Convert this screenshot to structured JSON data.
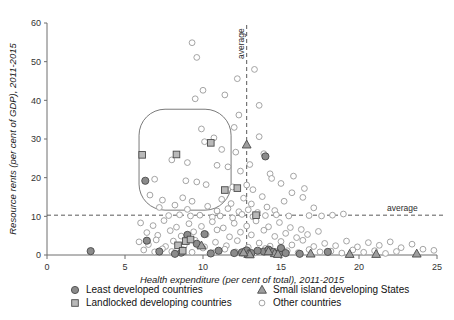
{
  "chart_data": {
    "type": "scatter",
    "title": "",
    "xlabel": "Health expenditure (per cent of total), 2011-2015",
    "ylabel": "Resource rents (per cent of GDP), 2011-2015",
    "xlim": [
      0,
      25
    ],
    "ylim": [
      0,
      60
    ],
    "xticks": [
      0,
      5,
      10,
      15,
      20,
      25
    ],
    "yticks": [
      0,
      10,
      20,
      30,
      40,
      50,
      60
    ],
    "grid": false,
    "legend_position": "below-axis",
    "annotations": [
      {
        "label": "average",
        "type": "vertical-line",
        "value": 12.8,
        "orientation": "vertical"
      },
      {
        "label": "average",
        "type": "horizontal-line",
        "value": 10.3,
        "orientation": "horizontal"
      },
      {
        "label": "",
        "type": "rounded-rect-highlight",
        "x_range": [
          5.9,
          11.8
        ],
        "y_range": [
          11.6,
          37.7
        ]
      }
    ],
    "series": [
      {
        "name": "Least developed countries",
        "marker": "filled-circle",
        "color": "#8b8b8b",
        "points": [
          [
            6.3,
            19.2
          ],
          [
            2.8,
            1.0
          ],
          [
            6.4,
            3.7
          ],
          [
            7.2,
            0.9
          ],
          [
            8.6,
            0.6
          ],
          [
            9.6,
            2.9
          ],
          [
            10.1,
            5.4
          ],
          [
            11.0,
            1.1
          ],
          [
            12.5,
            0.7
          ],
          [
            12.8,
            1.2
          ],
          [
            13.1,
            0.5
          ],
          [
            13.9,
            0.9
          ],
          [
            14.2,
            1.4
          ],
          [
            14.5,
            0.8
          ],
          [
            14.9,
            0.6
          ],
          [
            15.0,
            1.8
          ],
          [
            14.0,
            25.5
          ],
          [
            18.0,
            0.8
          ],
          [
            9.0,
            5.2
          ],
          [
            10.5,
            0.4
          ],
          [
            12.0,
            0.5
          ],
          [
            13.5,
            1.1
          ],
          [
            15.3,
            0.5
          ],
          [
            16.2,
            0.3
          ],
          [
            8.2,
            0.3
          ]
        ]
      },
      {
        "name": "Landlocked developing countries",
        "marker": "filled-square",
        "color": "#b9b9b9",
        "points": [
          [
            6.1,
            25.9
          ],
          [
            8.3,
            26.0
          ],
          [
            10.5,
            29.0
          ],
          [
            11.4,
            16.8
          ],
          [
            12.2,
            17.3
          ],
          [
            13.4,
            10.3
          ],
          [
            8.9,
            3.6
          ],
          [
            8.4,
            2.5
          ],
          [
            9.2,
            4.0
          ],
          [
            8.7,
            1.1
          ]
        ]
      },
      {
        "name": "Small island developing States",
        "marker": "filled-triangle",
        "color": "#9e9e9e",
        "points": [
          [
            12.8,
            28.5
          ],
          [
            9.9,
            2.4
          ],
          [
            12.9,
            0.2
          ],
          [
            13.0,
            0.1
          ],
          [
            14.6,
            0.4
          ],
          [
            14.8,
            0.2
          ],
          [
            16.9,
            0.3
          ],
          [
            19.4,
            0.2
          ],
          [
            21.1,
            0.2
          ],
          [
            23.7,
            0.3
          ],
          [
            14.2,
            0.9
          ],
          [
            12.6,
            0.6
          ]
        ]
      },
      {
        "name": "Other countries",
        "marker": "open-circle",
        "color": "#ffffff",
        "points": [
          [
            9.3,
            54.9
          ],
          [
            9.6,
            51.1
          ],
          [
            12.2,
            45.6
          ],
          [
            10.0,
            42.6
          ],
          [
            11.4,
            41.4
          ],
          [
            9.5,
            40.4
          ],
          [
            13.6,
            38.7
          ],
          [
            13.6,
            30.6
          ],
          [
            9.9,
            32.6
          ],
          [
            12.0,
            33.0
          ],
          [
            10.7,
            30.3
          ],
          [
            10.1,
            29.3
          ],
          [
            11.2,
            27.3
          ],
          [
            12.1,
            26.6
          ],
          [
            8.0,
            24.6
          ],
          [
            9.0,
            23.9
          ],
          [
            10.9,
            23.2
          ],
          [
            11.6,
            22.8
          ],
          [
            12.4,
            21.7
          ],
          [
            13.0,
            23.4
          ],
          [
            6.9,
            19.6
          ],
          [
            8.9,
            19.2
          ],
          [
            9.6,
            18.9
          ],
          [
            10.2,
            18.2
          ],
          [
            11.9,
            17.6
          ],
          [
            12.8,
            18.1
          ],
          [
            13.2,
            16.9
          ],
          [
            6.6,
            15.5
          ],
          [
            7.4,
            14.2
          ],
          [
            8.7,
            14.8
          ],
          [
            9.3,
            13.9
          ],
          [
            11.2,
            14.4
          ],
          [
            11.8,
            13.3
          ],
          [
            12.6,
            14.7
          ],
          [
            13.1,
            13.2
          ],
          [
            13.8,
            15.1
          ],
          [
            7.2,
            12.3
          ],
          [
            8.2,
            12.9
          ],
          [
            9.0,
            11.8
          ],
          [
            10.3,
            12.6
          ],
          [
            10.9,
            11.4
          ],
          [
            11.6,
            12.0
          ],
          [
            12.3,
            11.2
          ],
          [
            12.9,
            11.7
          ],
          [
            13.5,
            11.0
          ],
          [
            14.1,
            12.4
          ],
          [
            14.6,
            11.5
          ],
          [
            15.2,
            13.9
          ],
          [
            15.7,
            16.1
          ],
          [
            16.4,
            14.9
          ],
          [
            17.1,
            12.2
          ],
          [
            7.8,
            10.2
          ],
          [
            8.5,
            10.4
          ],
          [
            9.2,
            10.1
          ],
          [
            9.8,
            10.3
          ],
          [
            10.6,
            9.8
          ],
          [
            11.1,
            10.1
          ],
          [
            11.9,
            9.6
          ],
          [
            12.5,
            10.5
          ],
          [
            13.2,
            9.9
          ],
          [
            14.0,
            10.2
          ],
          [
            14.7,
            10.4
          ],
          [
            15.5,
            10.1
          ],
          [
            16.8,
            10.2
          ],
          [
            17.6,
            10.1
          ],
          [
            18.3,
            10.3
          ],
          [
            19.0,
            10.6
          ],
          [
            6.0,
            8.3
          ],
          [
            6.8,
            7.6
          ],
          [
            7.5,
            8.9
          ],
          [
            8.3,
            7.2
          ],
          [
            9.1,
            8.1
          ],
          [
            9.9,
            7.4
          ],
          [
            10.6,
            8.6
          ],
          [
            11.3,
            7.0
          ],
          [
            12.0,
            8.2
          ],
          [
            12.8,
            7.5
          ],
          [
            13.4,
            8.8
          ],
          [
            14.2,
            7.3
          ],
          [
            14.9,
            8.4
          ],
          [
            15.6,
            7.1
          ],
          [
            16.3,
            6.6
          ],
          [
            6.4,
            5.8
          ],
          [
            7.1,
            5.1
          ],
          [
            7.9,
            6.3
          ],
          [
            8.6,
            4.9
          ],
          [
            9.4,
            6.0
          ],
          [
            10.2,
            5.3
          ],
          [
            10.9,
            6.5
          ],
          [
            11.7,
            4.7
          ],
          [
            12.4,
            5.9
          ],
          [
            13.1,
            5.2
          ],
          [
            13.9,
            6.4
          ],
          [
            14.6,
            4.8
          ],
          [
            15.3,
            5.6
          ],
          [
            16.0,
            4.5
          ],
          [
            16.7,
            5.3
          ],
          [
            17.4,
            6.1
          ],
          [
            5.9,
            3.4
          ],
          [
            6.5,
            2.7
          ],
          [
            7.0,
            3.9
          ],
          [
            7.6,
            2.2
          ],
          [
            8.1,
            3.6
          ],
          [
            8.8,
            2.5
          ],
          [
            9.5,
            3.8
          ],
          [
            10.1,
            2.1
          ],
          [
            10.8,
            3.3
          ],
          [
            11.5,
            2.4
          ],
          [
            12.2,
            3.7
          ],
          [
            12.9,
            2.0
          ],
          [
            13.6,
            3.1
          ],
          [
            14.3,
            2.3
          ],
          [
            15.0,
            3.5
          ],
          [
            15.7,
            2.6
          ],
          [
            16.4,
            3.8
          ],
          [
            17.1,
            2.2
          ],
          [
            17.8,
            3.0
          ],
          [
            18.5,
            2.4
          ],
          [
            19.2,
            3.6
          ],
          [
            19.9,
            2.1
          ],
          [
            20.6,
            3.2
          ],
          [
            21.3,
            2.5
          ],
          [
            22.0,
            3.4
          ],
          [
            22.7,
            1.9
          ],
          [
            23.4,
            2.8
          ],
          [
            24.1,
            1.5
          ],
          [
            24.8,
            1.2
          ],
          [
            6.2,
            1.3
          ],
          [
            6.9,
            0.8
          ],
          [
            7.4,
            1.6
          ],
          [
            8.0,
            0.9
          ],
          [
            8.7,
            1.4
          ],
          [
            9.3,
            0.7
          ],
          [
            10.0,
            1.8
          ],
          [
            10.7,
            0.6
          ],
          [
            11.4,
            1.5
          ],
          [
            12.1,
            0.8
          ],
          [
            12.7,
            1.2
          ],
          [
            13.3,
            0.5
          ],
          [
            14.0,
            1.7
          ],
          [
            14.7,
            0.9
          ],
          [
            15.4,
            1.1
          ],
          [
            16.1,
            0.6
          ],
          [
            16.8,
            1.4
          ],
          [
            17.5,
            0.8
          ],
          [
            18.2,
            1.0
          ],
          [
            18.9,
            0.5
          ],
          [
            19.6,
            1.3
          ],
          [
            20.3,
            0.7
          ],
          [
            21.0,
            1.1
          ],
          [
            21.7,
            0.4
          ],
          [
            22.4,
            0.9
          ],
          [
            13.3,
            48.0
          ],
          [
            12.3,
            36.2
          ],
          [
            14.3,
            21.0
          ],
          [
            15.0,
            18.5
          ],
          [
            14.4,
            19.8
          ],
          [
            15.8,
            20.4
          ],
          [
            16.5,
            17.2
          ],
          [
            13.9,
            26.2
          ]
        ]
      }
    ]
  },
  "legend": {
    "entries": [
      {
        "label": "Least developed countries",
        "marker": "filled-circle"
      },
      {
        "label": "Landlocked developing countries",
        "marker": "filled-square"
      },
      {
        "label": "Small island developing States",
        "marker": "filled-triangle"
      },
      {
        "label": "Other countries",
        "marker": "open-circle"
      }
    ]
  },
  "colors": {
    "ldc": "#8b8b8b",
    "lldc": "#b9b9b9",
    "sids": "#9e9e9e",
    "other": "#ffffff",
    "axis": "#6e6e6e",
    "annotation": "#5a5a5a"
  }
}
